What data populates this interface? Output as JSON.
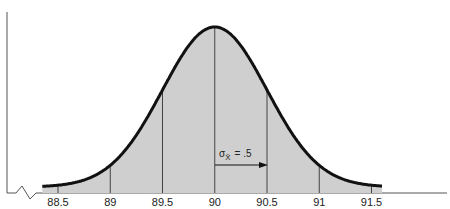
{
  "chart_data": {
    "type": "area",
    "title": "",
    "subtitle": "",
    "xlabel": "",
    "ylabel": "",
    "distribution": "normal",
    "mean": 90,
    "std_error": 0.5,
    "x_ticks": [
      88.5,
      89,
      89.5,
      90,
      90.5,
      91,
      91.5
    ],
    "tick_labels": [
      "88.5",
      "89",
      "89.5",
      "90",
      "90.5",
      "91",
      "91.5"
    ],
    "xlim": [
      88.5,
      91.5
    ],
    "grid": false,
    "legend": null,
    "annotations": [
      {
        "text_symbol": "σ",
        "text_subscript": "X̄",
        "text_value": "= .5",
        "type": "arrow",
        "from_x": 90,
        "to_x": 90.5,
        "label": "σX̄ = .5"
      }
    ],
    "axis_break": true,
    "fill_color": "#cfcfcf",
    "curve_color": "#111111"
  }
}
